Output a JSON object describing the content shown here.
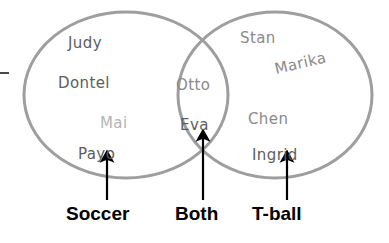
{
  "diagram": {
    "type": "venn-two-set",
    "colors": {
      "circle_stroke": "#9e9e9e",
      "background": "#ffffff",
      "name_text": "#5d5d5d",
      "name_text_light": "#b4b4b4",
      "name_text_mid": "#8a8a8a",
      "label_text": "#000000",
      "arrow": "#000000"
    }
  },
  "sets": {
    "left": {
      "label": "Soccer",
      "members": [
        {
          "name": "Judy",
          "tone": "dark"
        },
        {
          "name": "Dontel",
          "tone": "dark"
        },
        {
          "name": "Mai",
          "tone": "light"
        },
        {
          "name": "Payo",
          "tone": "dark"
        }
      ]
    },
    "intersection": {
      "label": "Both",
      "members": [
        {
          "name": "Otto",
          "tone": "mid"
        },
        {
          "name": "Eva",
          "tone": "dark"
        }
      ]
    },
    "right": {
      "label": "T-ball",
      "members": [
        {
          "name": "Stan",
          "tone": "mid"
        },
        {
          "name": "Marika",
          "tone": "mid"
        },
        {
          "name": "Chen",
          "tone": "mid"
        },
        {
          "name": "Ingrid",
          "tone": "dark"
        }
      ]
    }
  },
  "names": {
    "judy": "Judy",
    "dontel": "Dontel",
    "mai": "Mai",
    "payo": "Payo",
    "otto": "Otto",
    "eva": "Eva",
    "stan": "Stan",
    "marika": "Marika",
    "chen": "Chen",
    "ingrid": "Ingrid"
  },
  "labels": {
    "soccer": "Soccer",
    "both": "Both",
    "tball": "T-ball"
  },
  "counts": {
    "soccer_only": 4,
    "both": 2,
    "tball_only": 4,
    "total": 10
  }
}
